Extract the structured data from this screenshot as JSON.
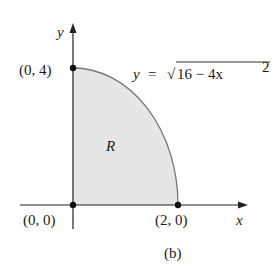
{
  "diagram": {
    "caption": "(b)",
    "region_label": "R",
    "axes": {
      "x_label": "x",
      "y_label": "y"
    },
    "points": [
      {
        "label": "(0, 4)",
        "x": 0,
        "y": 4
      },
      {
        "label": "(0, 0)",
        "x": 0,
        "y": 0
      },
      {
        "label": "(2, 0)",
        "x": 2,
        "y": 0
      }
    ],
    "curve": {
      "lhs": "y",
      "eq": "=",
      "radical": "√",
      "radicand": "16 − 4x",
      "exponent": "2"
    },
    "colors": {
      "region_fill": "#e6e6e6",
      "curve": "#777777",
      "axis": "#222222"
    }
  }
}
